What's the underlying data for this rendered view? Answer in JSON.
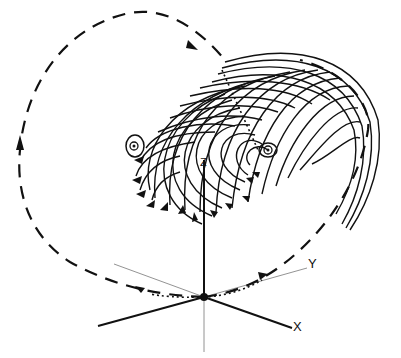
{
  "diagram": {
    "type": "3d-flow-field",
    "axes": {
      "x_label": "X",
      "y_label": "Y",
      "z_label": "Z"
    },
    "elements": {
      "origin_point": "fixed-point",
      "dashed_orbit": "trajectory-loop",
      "spiral_sheet": "streamline-spiral",
      "vortex_left": "focus-point",
      "vortex_right": "focus-point"
    },
    "colors": {
      "ink": "#111111",
      "background": "#ffffff",
      "thin_axis": "#777777"
    }
  }
}
